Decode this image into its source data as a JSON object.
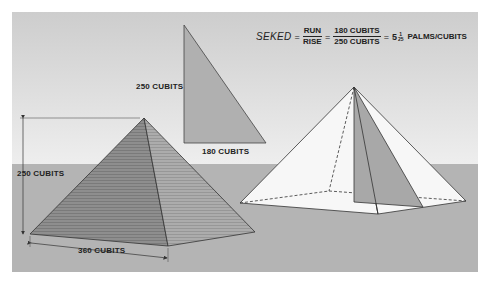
{
  "colors": {
    "sky_top": "#cfcfcf",
    "sky_bottom": "#ececec",
    "ground": "#b4b4b4",
    "pyramid_left_face": "#8f8f8f",
    "pyramid_right_face": "#a9a9a9",
    "triangle_fill": "#b0b0b0",
    "wire_fill": "#f7f7f7",
    "line": "#333333"
  },
  "formula": {
    "term": "SEKED",
    "equals": "=",
    "ratio_num": "RUN",
    "ratio_den": "RISE",
    "value_num": "180 CUBITS",
    "value_den": "250 CUBITS",
    "result_whole": "5",
    "result_frac_num": "1",
    "result_frac_den": "25",
    "result_unit": "PALMS/CUBITS"
  },
  "triangle": {
    "height_label": "250  CUBITS",
    "base_label": "180  CUBITS"
  },
  "solid_pyramid": {
    "height_label": "250  CUBITS",
    "base_label": "360  CUBITS"
  }
}
